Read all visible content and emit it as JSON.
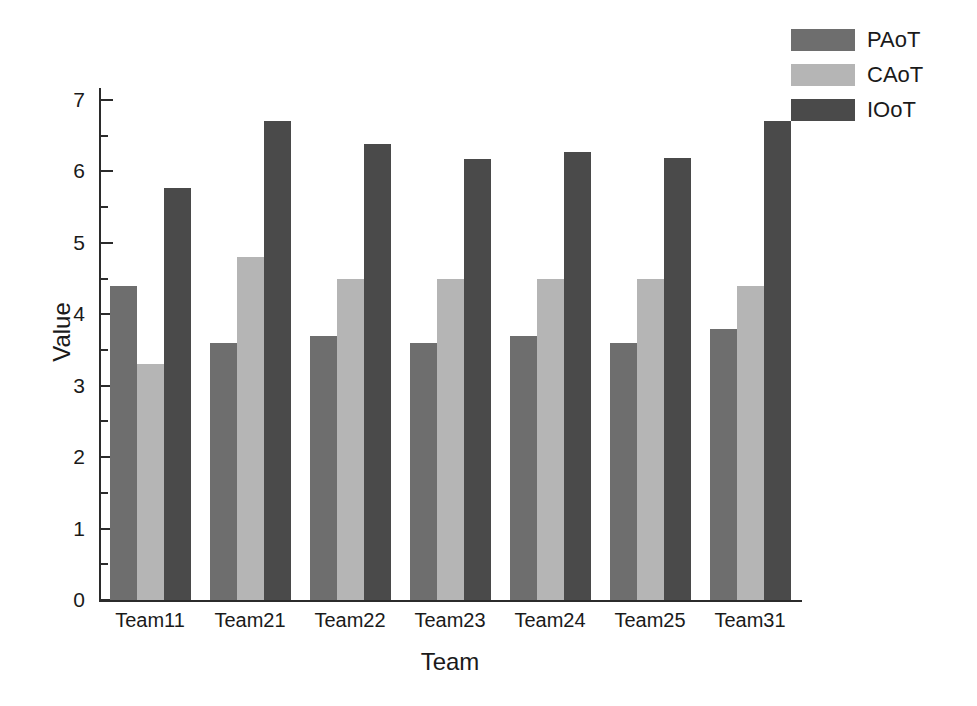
{
  "chart_data": {
    "type": "bar",
    "title": "",
    "xlabel": "Team",
    "ylabel": "Value",
    "categories": [
      "Team11",
      "Team21",
      "Team22",
      "Team23",
      "Team24",
      "Team25",
      "Team31"
    ],
    "series": [
      {
        "name": "PAoT",
        "color": "#6e6e6e",
        "values": [
          4.4,
          3.6,
          3.7,
          3.6,
          3.7,
          3.6,
          3.8
        ]
      },
      {
        "name": "CAoT",
        "color": "#b5b5b5",
        "values": [
          3.3,
          4.8,
          4.5,
          4.5,
          4.5,
          4.5,
          4.4
        ]
      },
      {
        "name": "IOoT",
        "color": "#4a4a4a",
        "values": [
          5.77,
          6.7,
          6.38,
          6.18,
          6.27,
          6.19,
          6.71
        ]
      }
    ],
    "ylim": [
      0,
      7
    ],
    "y_major_ticks": [
      0,
      1,
      2,
      3,
      4,
      5,
      6,
      7
    ],
    "y_minor_ticks": [
      0.5,
      1.5,
      2.5,
      3.5,
      4.5,
      5.5,
      6.5
    ],
    "y_tick_labels": [
      "0",
      "1",
      "2",
      "3",
      "4",
      "5",
      "6",
      "7"
    ],
    "grid": false,
    "legend_position": "top-right",
    "axis_style": "left-bottom-only",
    "tick_direction": "in"
  }
}
